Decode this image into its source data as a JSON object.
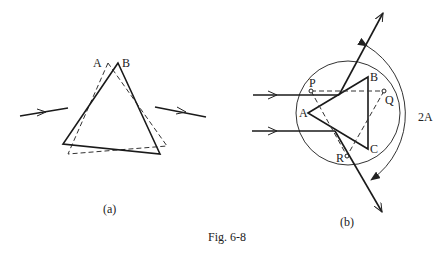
{
  "figure": {
    "caption": "Fig. 6-8",
    "panels": [
      {
        "id": "a",
        "label": "(a)",
        "vertex_labels": {
          "A": "A",
          "B": "B"
        }
      },
      {
        "id": "b",
        "label": "(b)",
        "vertex_labels": {
          "A": "A",
          "B": "B",
          "C": "C",
          "P": "P",
          "Q": "Q",
          "R": "R"
        },
        "angle_label": "2A"
      }
    ]
  }
}
